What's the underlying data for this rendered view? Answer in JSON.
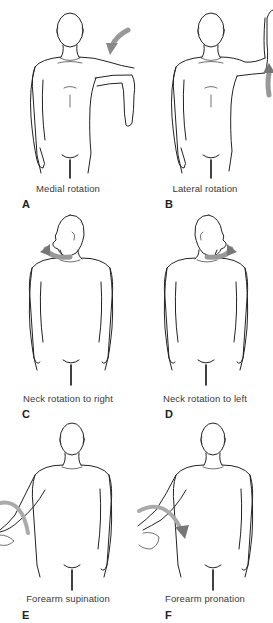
{
  "figure": {
    "panels": [
      {
        "letter": "A",
        "caption": "Medial rotation",
        "arrow_direction": "inward toward shoulder"
      },
      {
        "letter": "B",
        "caption": "Lateral rotation",
        "arrow_direction": "upward at elbow"
      },
      {
        "letter": "C",
        "caption": "Neck rotation to right",
        "arrow_direction": "head turns to figure's right"
      },
      {
        "letter": "D",
        "caption": "Neck rotation to left",
        "arrow_direction": "head turns to figure's left"
      },
      {
        "letter": "E",
        "caption": "Forearm supination",
        "arrow_direction": "curved arc around forearm"
      },
      {
        "letter": "F",
        "caption": "Forearm pronation",
        "arrow_direction": "curved arc downward"
      }
    ],
    "colors": {
      "line_art": "#222222",
      "arrow": "#8a8a8a",
      "caption_text": "#3a3a3a",
      "background": "#ffffff"
    }
  }
}
